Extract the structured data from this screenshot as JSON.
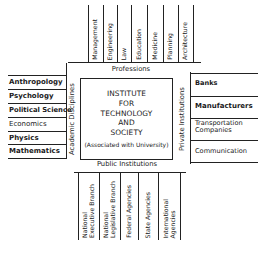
{
  "diagram": {
    "center": {
      "lines": [
        "INSTITUTE",
        "FOR",
        "TECHNOLOGY",
        "AND",
        "SOCIETY"
      ],
      "subtitle": "(Associated with University)"
    },
    "top": {
      "label": "Professions",
      "items": [
        "Management",
        "Engineering",
        "Law",
        "Education",
        "Medicine",
        "Planning",
        "Architecture"
      ]
    },
    "left": {
      "label": "Academic Disciplines",
      "items": [
        "Anthropology",
        "Psychology",
        "Political Science",
        "Economics",
        "Physics",
        "Mathematics"
      ]
    },
    "right": {
      "label": "Private Institutions",
      "items": [
        "Banks",
        "Manufacturers",
        "Transportation Companies",
        "Communication"
      ],
      "items_lines": [
        [
          "Banks"
        ],
        [
          "Manufacturers"
        ],
        [
          "Transportation",
          "Companies"
        ],
        [
          "Communication"
        ]
      ]
    },
    "bottom": {
      "label": "Public Institutions",
      "items": [
        "National Executive Branch",
        "National Legislative Branch",
        "Federal Agencies",
        "State Agencies",
        "International Agencies"
      ],
      "items_lines": [
        [
          "National",
          "Executive Branch"
        ],
        [
          "National",
          "Legislative Branch"
        ],
        [
          "Federal Agencies"
        ],
        [
          "State Agencies"
        ],
        [
          "International",
          "Agencies"
        ]
      ]
    }
  }
}
